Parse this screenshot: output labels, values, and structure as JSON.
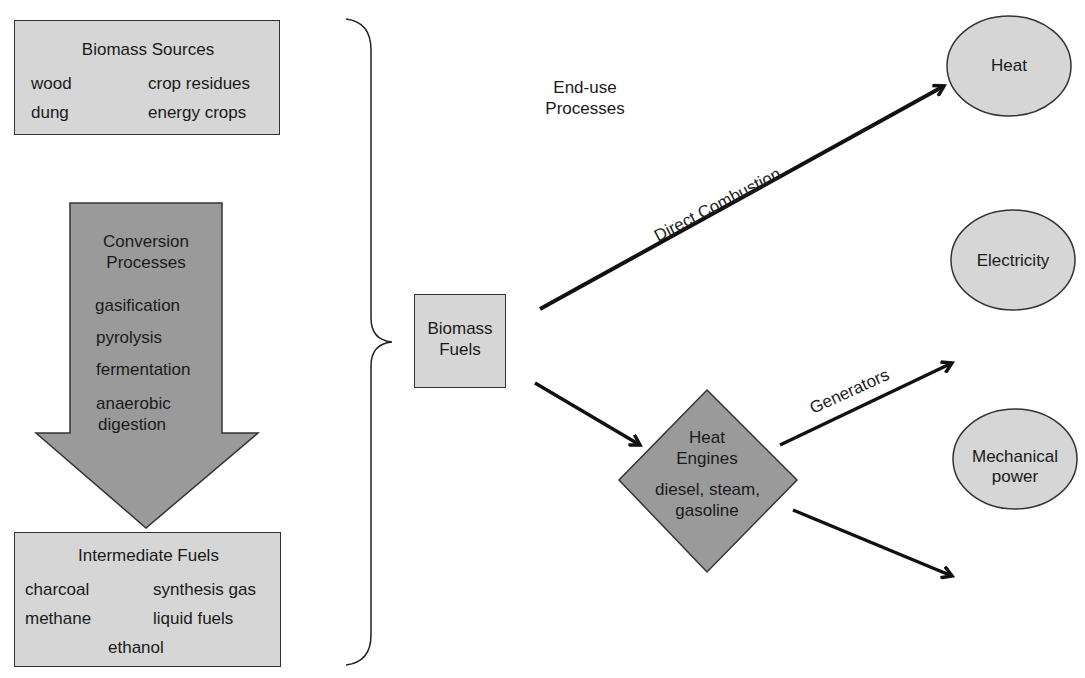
{
  "colors": {
    "light_fill": "#d6d6d6",
    "dark_fill": "#9a9a9a",
    "stroke": "#222222",
    "background": "#ffffff"
  },
  "biomass_sources": {
    "title": "Biomass Sources",
    "items": [
      "wood",
      "crop residues",
      "dung",
      "energy crops"
    ]
  },
  "conversion": {
    "title_line1": "Conversion",
    "title_line2": "Processes",
    "items": [
      "gasification",
      "pyrolysis",
      "fermentation",
      "anaerobic",
      "digestion"
    ]
  },
  "intermediate_fuels": {
    "title": "Intermediate Fuels",
    "items": [
      "charcoal",
      "synthesis gas",
      "methane",
      "liquid fuels",
      "ethanol"
    ]
  },
  "end_use_label": {
    "line1": "End-use",
    "line2": "Processes"
  },
  "biomass_fuels": {
    "line1": "Biomass",
    "line2": "Fuels"
  },
  "heat_engines": {
    "line1": "Heat",
    "line2": "Engines",
    "line3": "diesel, steam,",
    "line4": "gasoline"
  },
  "edges": {
    "direct_combustion": "Direct Combustion",
    "generators": "Generators"
  },
  "outputs": {
    "heat": "Heat",
    "electricity": "Electricity",
    "mechanical_line1": "Mechanical",
    "mechanical_line2": "power"
  }
}
